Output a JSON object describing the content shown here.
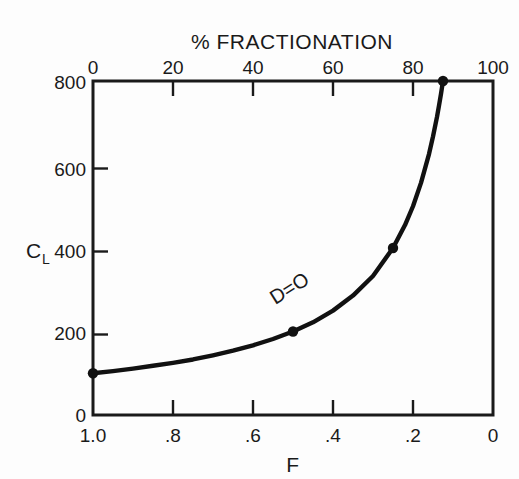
{
  "figure": {
    "background_color": "#fdfdfd",
    "ink_color": "#1a1a1a"
  },
  "chart_data": {
    "type": "line",
    "title": "",
    "xlabel": "F",
    "ylabel": "C_L",
    "top_axis_label": "% FRACTIONATION",
    "x": [
      1.0,
      0.95,
      0.9,
      0.85,
      0.8,
      0.75,
      0.7,
      0.65,
      0.6,
      0.55,
      0.5,
      0.45,
      0.4,
      0.35,
      0.3,
      0.25,
      0.22,
      0.2,
      0.18,
      0.16,
      0.15,
      0.14,
      0.135,
      0.13,
      0.126,
      0.125
    ],
    "values": [
      100,
      105,
      111,
      118,
      125,
      133,
      143,
      154,
      167,
      182,
      200,
      222,
      250,
      286,
      333,
      400,
      455,
      500,
      556,
      625,
      667,
      714,
      741,
      769,
      794,
      800
    ],
    "markers": [
      {
        "x": 1.0,
        "y": 100
      },
      {
        "x": 0.5,
        "y": 200
      },
      {
        "x": 0.25,
        "y": 400
      },
      {
        "x": 0.125,
        "y": 800
      }
    ],
    "annotations": [
      {
        "text": "D=O",
        "x": 0.38,
        "y": 300,
        "rotation": -32
      }
    ],
    "xlim": [
      1.0,
      0.0
    ],
    "ylim": [
      0,
      800
    ],
    "x_reversed": true,
    "xticks": [
      1.0,
      0.8,
      0.6,
      0.4,
      0.2,
      0.0
    ],
    "xticklabels": [
      "1.0",
      ".8",
      ".6",
      ".4",
      ".2",
      "0"
    ],
    "yticks": [
      0,
      200,
      400,
      600,
      800
    ],
    "yticklabels": [
      "0",
      "200",
      "400",
      "600",
      "800"
    ],
    "top_xticks": [
      0,
      20,
      40,
      60,
      80,
      100
    ],
    "top_xticklabels": [
      "0",
      "20",
      "40",
      "60",
      "80",
      "100"
    ],
    "grid": false,
    "legend": false,
    "line_color": "#111111",
    "marker_color": "#111111"
  },
  "labels": {
    "top_axis_title": "% FRACTIONATION",
    "bottom_axis_title": "F",
    "y_axis_symbol": "C",
    "y_axis_subscript": "L",
    "curve_annotation": "D=O",
    "top_ticks": {
      "t0": "0",
      "t1": "20",
      "t2": "40",
      "t3": "60",
      "t4": "80",
      "t5": "100"
    },
    "bottom_ticks": {
      "t0": "1.0",
      "t1": ".8",
      "t2": ".6",
      "t3": ".4",
      "t4": ".2",
      "t5": "0"
    },
    "left_ticks": {
      "t0": "0",
      "t1": "200",
      "t2": "400",
      "t3": "600",
      "t4": "800"
    }
  }
}
